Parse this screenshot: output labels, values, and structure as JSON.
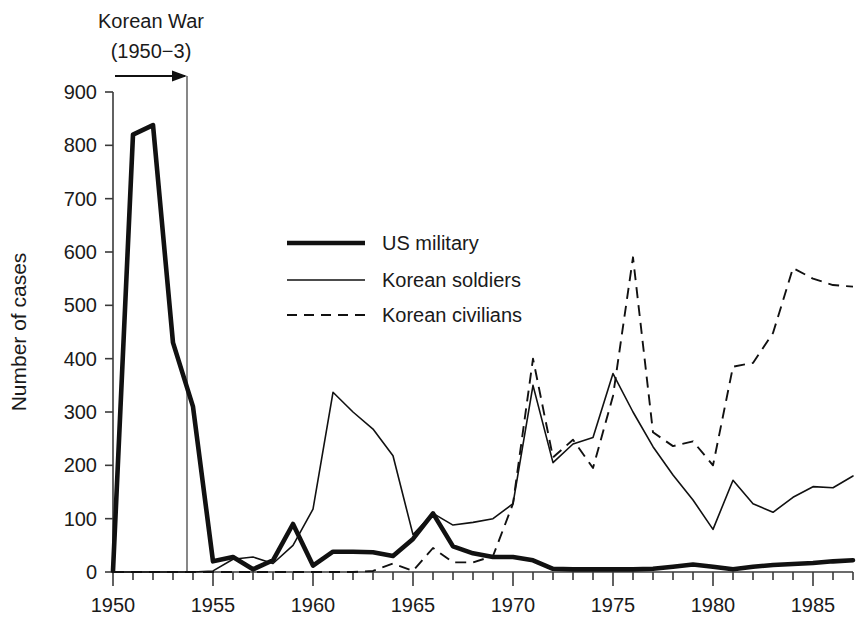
{
  "chart_data": {
    "type": "line",
    "title": "",
    "xlabel": "",
    "ylabel": "Number of cases",
    "xlim": [
      1950,
      1987
    ],
    "ylim": [
      0,
      900
    ],
    "grid": false,
    "legend_position": "upper-center-left",
    "x_tick_labels": [
      "1950",
      "1955",
      "1960",
      "1965",
      "1970",
      "1975",
      "1980",
      "1985"
    ],
    "x_major_ticks": [
      1950,
      1955,
      1960,
      1965,
      1970,
      1975,
      1980,
      1985
    ],
    "x_minor_tick_step": 1,
    "y_tick_labels": [
      "0",
      "100",
      "200",
      "300",
      "400",
      "500",
      "600",
      "700",
      "800",
      "900"
    ],
    "y_ticks": [
      0,
      100,
      200,
      300,
      400,
      500,
      600,
      700,
      800,
      900
    ],
    "x": [
      1950,
      1951,
      1952,
      1953,
      1954,
      1955,
      1956,
      1957,
      1958,
      1959,
      1960,
      1961,
      1962,
      1963,
      1964,
      1965,
      1966,
      1967,
      1968,
      1969,
      1970,
      1971,
      1972,
      1973,
      1974,
      1975,
      1976,
      1977,
      1978,
      1979,
      1980,
      1981,
      1982,
      1983,
      1984,
      1985,
      1986,
      1987
    ],
    "series": [
      {
        "name": "US military",
        "style": "thick-solid",
        "color": "#111111",
        "values": [
          2,
          820,
          838,
          430,
          310,
          20,
          28,
          5,
          22,
          90,
          12,
          38,
          38,
          37,
          30,
          62,
          110,
          48,
          35,
          28,
          28,
          22,
          6,
          5,
          5,
          5,
          5,
          6,
          10,
          14,
          10,
          5,
          10,
          13,
          15,
          17,
          20,
          22
        ]
      },
      {
        "name": "Korean soldiers",
        "style": "thin-solid",
        "color": "#111111",
        "values": [
          0,
          0,
          0,
          0,
          0,
          2,
          24,
          28,
          16,
          50,
          118,
          337,
          300,
          268,
          218,
          70,
          110,
          88,
          93,
          100,
          128,
          350,
          205,
          240,
          252,
          372,
          300,
          235,
          182,
          135,
          80,
          172,
          128,
          112,
          140,
          160,
          158,
          180
        ]
      },
      {
        "name": "Korean civilians",
        "style": "dashed",
        "color": "#111111",
        "values": [
          0,
          0,
          0,
          0,
          0,
          0,
          0,
          0,
          0,
          0,
          0,
          0,
          0,
          2,
          16,
          2,
          45,
          18,
          18,
          30,
          128,
          400,
          215,
          248,
          195,
          330,
          590,
          262,
          236,
          245,
          200,
          385,
          392,
          448,
          570,
          550,
          538,
          535
        ]
      }
    ],
    "annotations": [
      {
        "name": "korean-war",
        "line1": "Korean War",
        "line2": "(1950−3)",
        "arrow_from_year": 1951.2,
        "arrow_to_year": 1953.7,
        "event_line_year": 1953.7
      }
    ]
  },
  "legend": {
    "items": [
      {
        "label": "US military",
        "style": "thick-solid"
      },
      {
        "label": "Korean soldiers",
        "style": "thin-solid"
      },
      {
        "label": "Korean civilians",
        "style": "dashed"
      }
    ]
  },
  "colors": {
    "background": "#ffffff",
    "ink": "#111111",
    "axis": "#3a3a3a",
    "event_line": "#555555"
  }
}
